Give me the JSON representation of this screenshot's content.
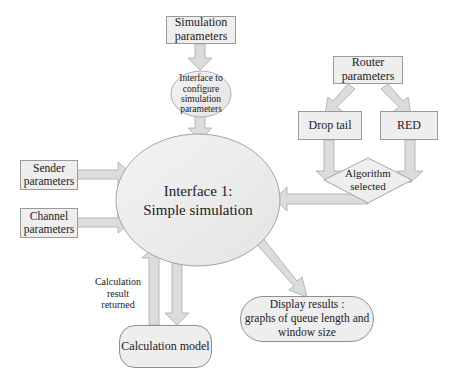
{
  "diagram": {
    "nodes": {
      "simulation_parameters": {
        "label": "Simulation parameters",
        "line1": "Simulation",
        "line2": "parameters",
        "shape": "rectangle"
      },
      "interface_configure": {
        "label": "Interface to configure simulation parameters",
        "line1": "Interface to",
        "line2": "configure",
        "line3": "simulation",
        "line4": "parameters",
        "shape": "ellipse"
      },
      "router_parameters": {
        "label": "Router parameters",
        "line1": "Router",
        "line2": "parameters",
        "shape": "rectangle"
      },
      "drop_tail": {
        "label": "Drop tail",
        "shape": "rectangle"
      },
      "red": {
        "label": "RED",
        "shape": "rectangle"
      },
      "algorithm_selected": {
        "label": "Algorithm selected",
        "line1": "Algorithm",
        "line2": "selected",
        "shape": "diamond"
      },
      "sender_parameters": {
        "label": "Sender parameters",
        "line1": "Sender",
        "line2": "parameters",
        "shape": "rectangle"
      },
      "channel_parameters": {
        "label": "Channel parameters",
        "line1": "Channel",
        "line2": "parameters",
        "shape": "rectangle"
      },
      "interface_1": {
        "label": "Interface 1: Simple simulation",
        "line1": "Interface 1:",
        "line2": "Simple simulation",
        "shape": "ellipse"
      },
      "calculation_model": {
        "label": "Calculation model",
        "shape": "rounded-rectangle"
      },
      "display_results": {
        "label": "Display results : graphs of queue length and window size",
        "line1": "Display results :",
        "line2": "graphs of queue length and",
        "line3": "window size",
        "shape": "pill"
      }
    },
    "edge_labels": {
      "calculation_result_returned": {
        "line1": "Calculation",
        "line2": "result",
        "line3": "returned"
      }
    },
    "edges": [
      {
        "from": "Simulation parameters",
        "to": "Interface to configure simulation parameters"
      },
      {
        "from": "Interface to configure simulation parameters",
        "to": "Interface 1: Simple simulation"
      },
      {
        "from": "Router parameters",
        "to": "Drop tail"
      },
      {
        "from": "Router parameters",
        "to": "RED"
      },
      {
        "from": "Drop tail",
        "to": "Algorithm selected"
      },
      {
        "from": "RED",
        "to": "Algorithm selected"
      },
      {
        "from": "Algorithm selected",
        "to": "Interface 1: Simple simulation"
      },
      {
        "from": "Sender parameters",
        "to": "Interface 1: Simple simulation"
      },
      {
        "from": "Channel parameters",
        "to": "Interface 1: Simple simulation"
      },
      {
        "from": "Interface 1: Simple simulation",
        "to": "Calculation model"
      },
      {
        "from": "Calculation model",
        "to": "Interface 1: Simple simulation",
        "label": "Calculation result returned"
      },
      {
        "from": "Interface 1: Simple simulation",
        "to": "Display results : graphs of queue length and window size"
      }
    ],
    "colors": {
      "node_fill": "#eeeeee",
      "node_border": "#9a9a9a",
      "arrow_fill": "#dcdcdc",
      "arrow_stroke": "#a8a8a8",
      "text": "#222222"
    }
  }
}
